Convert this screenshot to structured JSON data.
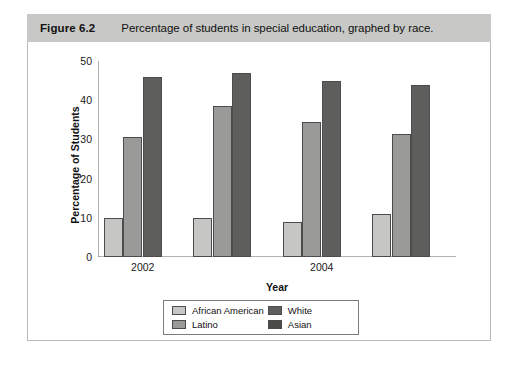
{
  "figure": {
    "number": "Figure 6.2",
    "caption": "Percentage of students in special education, graphed by race."
  },
  "chart_data": {
    "type": "bar",
    "title": "Percentage of students in special education, graphed by race.",
    "xlabel": "Year",
    "ylabel": "Percentage of Students",
    "ylim": [
      0,
      50
    ],
    "yticks": [
      0,
      10,
      20,
      30,
      40,
      50
    ],
    "grid": false,
    "legend_position": "bottom-center",
    "categories": [
      "2002",
      "",
      "2004",
      ""
    ],
    "visible_tick_labels": [
      "2002",
      "2004"
    ],
    "series": [
      {
        "name": "African American",
        "color": "#c6c6c4",
        "values": [
          10,
          10,
          9,
          11
        ]
      },
      {
        "name": "Latino",
        "color": "#9a9a98",
        "values": [
          30.5,
          38.5,
          34.5,
          31.5
        ]
      },
      {
        "name": "White",
        "color": "#5e5e5c",
        "values": [
          46,
          47,
          45,
          43.8
        ]
      },
      {
        "name": "Asian",
        "color": "#4a4a48",
        "values": [
          null,
          null,
          null,
          null
        ]
      }
    ]
  },
  "legend": {
    "entries": [
      {
        "label": "African American",
        "color": "#c6c6c4"
      },
      {
        "label": "White",
        "color": "#5e5e5c"
      },
      {
        "label": "Latino",
        "color": "#9a9a98"
      },
      {
        "label": "Asian",
        "color": "#4a4a48"
      }
    ]
  }
}
